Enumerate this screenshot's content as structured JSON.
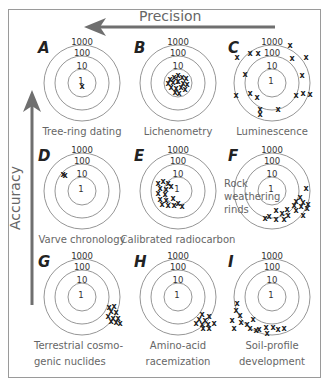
{
  "header": {
    "title": "Precision",
    "axis_vertical": "Accuracy"
  },
  "colors": {
    "arrow": "#6f6f6f",
    "ring": "#8a8a8a",
    "frame": "#9a9a9a",
    "text": "#666666",
    "mark": "#222222"
  },
  "ring_labels": [
    "1000",
    "100",
    "10",
    "1"
  ],
  "panels": [
    {
      "letter": "A",
      "caption": [
        "Tree-ring dating"
      ],
      "cx": 82,
      "cy": 83,
      "marks": [
        [
          0,
          3
        ]
      ]
    },
    {
      "letter": "B",
      "caption": [
        "Lichenometry"
      ],
      "cx": 178,
      "cy": 83,
      "marks": [
        [
          -8,
          -4
        ],
        [
          -4,
          -6
        ],
        [
          0,
          -8
        ],
        [
          4,
          -6
        ],
        [
          8,
          -5
        ],
        [
          -10,
          0
        ],
        [
          -5,
          -1
        ],
        [
          0,
          -2
        ],
        [
          5,
          0
        ],
        [
          9,
          1
        ],
        [
          -7,
          4
        ],
        [
          -2,
          5
        ],
        [
          3,
          4
        ],
        [
          7,
          6
        ],
        [
          -3,
          9
        ],
        [
          1,
          10
        ]
      ]
    },
    {
      "letter": "C",
      "caption": [
        "Luminescence"
      ],
      "cx": 272,
      "cy": 83,
      "marks": [
        [
          18,
          -38
        ],
        [
          -22,
          -30
        ],
        [
          -14,
          -30
        ],
        [
          -35,
          -26
        ],
        [
          20,
          -25
        ],
        [
          34,
          -26
        ],
        [
          -27,
          -9
        ],
        [
          30,
          -8
        ],
        [
          -36,
          12
        ],
        [
          -22,
          10
        ],
        [
          -15,
          14
        ],
        [
          24,
          12
        ],
        [
          31,
          10
        ],
        [
          38,
          11
        ],
        [
          -12,
          26
        ],
        [
          6,
          26
        ],
        [
          -12,
          31
        ]
      ]
    },
    {
      "letter": "D",
      "caption": [
        "Varve chronology"
      ],
      "cx": 82,
      "cy": 191,
      "marks": [
        [
          -19,
          -17
        ],
        [
          -17,
          -16
        ]
      ]
    },
    {
      "letter": "E",
      "caption": [
        "Calibrated radiocarbon"
      ],
      "cx": 178,
      "cy": 191,
      "marks": [
        [
          -20,
          -8
        ],
        [
          -15,
          -10
        ],
        [
          -10,
          -8
        ],
        [
          -18,
          -3
        ],
        [
          -12,
          -2
        ],
        [
          -7,
          -5
        ],
        [
          -20,
          2
        ],
        [
          -13,
          3
        ],
        [
          -18,
          8
        ],
        [
          -12,
          9
        ],
        [
          -5,
          7
        ],
        [
          -16,
          13
        ],
        [
          -10,
          14
        ],
        [
          -4,
          14
        ],
        [
          0,
          12
        ],
        [
          4,
          15
        ]
      ]
    },
    {
      "letter": "F",
      "caption": [
        "Rock",
        "weathering",
        "rinds"
      ],
      "cx": 272,
      "cy": 191,
      "marks": [
        [
          34,
          -3
        ],
        [
          28,
          6
        ],
        [
          24,
          10
        ],
        [
          31,
          11
        ],
        [
          36,
          13
        ],
        [
          22,
          14
        ],
        [
          29,
          15
        ],
        [
          35,
          17
        ],
        [
          4,
          19
        ],
        [
          15,
          18
        ],
        [
          24,
          19
        ],
        [
          10,
          22
        ],
        [
          16,
          24
        ],
        [
          31,
          24
        ],
        [
          -3,
          25
        ],
        [
          4,
          28
        ],
        [
          12,
          28
        ],
        [
          -7,
          27
        ]
      ]
    },
    {
      "letter": "G",
      "caption": [
        "Terrestrial cosmo-",
        "genic nuclides"
      ],
      "cx": 82,
      "cy": 297,
      "marks": [
        [
          27,
          10
        ],
        [
          32,
          9
        ],
        [
          29,
          14
        ],
        [
          34,
          15
        ],
        [
          26,
          19
        ],
        [
          31,
          21
        ],
        [
          36,
          21
        ],
        [
          29,
          24
        ],
        [
          34,
          25
        ],
        [
          38,
          26
        ]
      ]
    },
    {
      "letter": "H",
      "caption": [
        "Amino-acid",
        "racemization"
      ],
      "cx": 178,
      "cy": 297,
      "marks": [
        [
          24,
          17
        ],
        [
          31,
          19
        ],
        [
          21,
          22
        ],
        [
          27,
          23
        ],
        [
          18,
          26
        ],
        [
          24,
          27
        ],
        [
          30,
          27
        ],
        [
          36,
          26
        ],
        [
          25,
          31
        ],
        [
          31,
          31
        ]
      ]
    },
    {
      "letter": "I",
      "caption": [
        "Soil-profile",
        "development"
      ],
      "cx": 272,
      "cy": 297,
      "marks": [
        [
          -35,
          6
        ],
        [
          -36,
          13
        ],
        [
          -32,
          18
        ],
        [
          -40,
          23
        ],
        [
          -31,
          25
        ],
        [
          -25,
          27
        ],
        [
          -19,
          22
        ],
        [
          -38,
          31
        ],
        [
          -22,
          31
        ],
        [
          -16,
          33
        ],
        [
          -13,
          32
        ],
        [
          -6,
          30
        ],
        [
          1,
          30
        ],
        [
          6,
          32
        ],
        [
          12,
          31
        ],
        [
          -5,
          36
        ]
      ]
    }
  ]
}
